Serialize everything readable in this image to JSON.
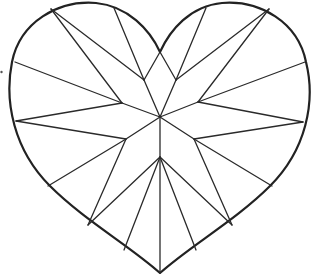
{
  "figure": {
    "stroke_color": "#222222",
    "background": "#ffffff",
    "center": [
      160,
      117
    ],
    "bottom_tip": [
      160,
      273
    ],
    "top_cleft": [
      160,
      52
    ],
    "inner_vertices": [
      [
        144,
        80
      ],
      [
        176,
        80
      ],
      [
        122,
        103
      ],
      [
        198,
        102
      ],
      [
        126,
        139
      ],
      [
        194,
        139
      ],
      [
        160,
        157
      ]
    ],
    "facet_count": 16
  }
}
